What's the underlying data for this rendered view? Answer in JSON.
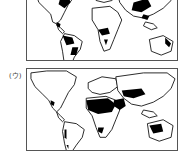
{
  "maps": [
    {
      "label": "",
      "description": "World map with black shaded regions in eastern North America, Central/South America (Amazon, southern Brazil), central/southern Africa, eastern China, South/Southeast Asia and eastern Australia"
    },
    {
      "label": "(ウ)",
      "description": "World map with black shaded regions in North Africa (Sahara), Arabian Peninsula, Central Asia, western Australia, southern Africa (Kalahari/Namib) and western South America coast"
    }
  ],
  "colors": {
    "highlight": "#000000",
    "land": "#ffffff",
    "outline": "#111111"
  }
}
